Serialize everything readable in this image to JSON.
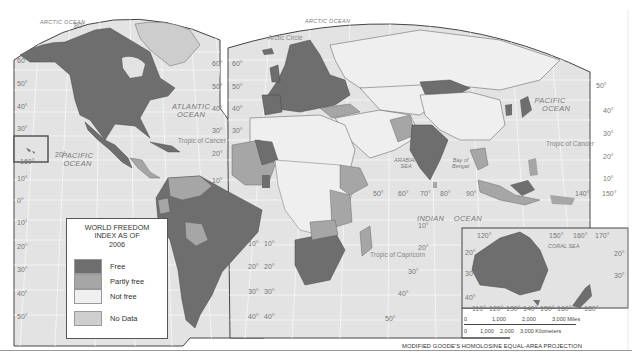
{
  "map": {
    "title": "World Freedom Index as of 2006",
    "projection": "MODIFIED GOODE'S HOMOLOSINE EQUAL-AREA PROJECTION",
    "colors": {
      "ocean": "#e4e4e4",
      "free": "#6e6e6e",
      "partly_free": "#a6a6a6",
      "not_free": "#efefef",
      "no_data": "#cfcfcf",
      "border": "#444444"
    },
    "oceans": [
      {
        "name": "ARCTIC OCEAN",
        "id": "arctic-ocean-west"
      },
      {
        "name": "ATLANTIC OCEAN",
        "id": "atlantic-ocean"
      },
      {
        "name": "PACIFIC OCEAN",
        "id": "pacific-ocean-west"
      },
      {
        "name": "ARCTIC OCEAN",
        "id": "arctic-ocean-east"
      },
      {
        "name": "PACIFIC OCEAN",
        "id": "pacific-ocean-east"
      },
      {
        "name": "INDIAN OCEAN",
        "id": "indian-ocean"
      }
    ],
    "labels": {
      "arctic_west": "ARCTIC OCEAN",
      "arctic_east": "ARCTIC OCEAN",
      "arctic_circle": "Arctic Circle",
      "atlantic_1": "ATLANTIC",
      "atlantic_2": "OCEAN",
      "pacific_w_1": "PACIFIC",
      "pacific_w_2": "OCEAN",
      "pacific_e_1": "PACIFIC",
      "pacific_e_2": "OCEAN",
      "indian_1": "INDIAN",
      "indian_2": "OCEAN",
      "arabian_1": "ARABIAN",
      "arabian_2": "SEA",
      "bengal_1": "Bay of",
      "bengal_2": "Bengal",
      "coral_sea": "CORAL SEA",
      "tropic_cancer_w": "Tropic of Cancer",
      "tropic_cancer_e": "Tropic of Cancer",
      "tropic_capricorn": "Tropic of Capricorn"
    },
    "lat_ticks_left": [
      "80°",
      "60°",
      "50°",
      "40°",
      "30°",
      "20°",
      "10°",
      "0°",
      "10°",
      "20°",
      "30°",
      "40°",
      "50°"
    ],
    "lat_ticks_mid_a": [
      "60°",
      "50°",
      "40°",
      "30°",
      "20°",
      "10°",
      "0°",
      "10°",
      "20°",
      "30°",
      "40°",
      "50°"
    ],
    "lat_ticks_mid_b": [
      "60°",
      "50°",
      "40°",
      "30°",
      "20°",
      "10°",
      "0°",
      "10°",
      "20°",
      "30°",
      "40°",
      "50°"
    ],
    "lat_ticks_right": [
      "50°",
      "40°",
      "30°",
      "20°",
      "10°"
    ],
    "lat_ticks_africa": [
      "10°",
      "20°",
      "30°",
      "40°",
      "50°"
    ],
    "lon_ticks_indian": [
      "50°",
      "60°",
      "70°",
      "80°",
      "90°"
    ],
    "lon_ticks_pacific": [
      "140°",
      "150°"
    ],
    "hawaii_inset": {
      "lon": "160°",
      "lat": "20°"
    },
    "australia_inset": {
      "lon_top": [
        "120°",
        "150°",
        "160°",
        "170°"
      ],
      "lon_bottom": [
        "110°",
        "120°",
        "130°",
        "140°",
        "150°",
        "160°",
        "180°"
      ],
      "lat": [
        "20°",
        "30°",
        "40°"
      ],
      "lat_right": [
        "20°",
        "30°"
      ]
    }
  },
  "legend": {
    "title_lines": [
      "WORLD FREEDOM",
      "INDEX AS OF",
      "2006"
    ],
    "items": [
      {
        "label": "Free",
        "color": "#6e6e6e"
      },
      {
        "label": "Partly free",
        "color": "#a6a6a6"
      },
      {
        "label": "Not free",
        "color": "#efefef"
      },
      {
        "label": "No Data",
        "color": "#cfcfcf"
      }
    ]
  },
  "scale_bar": {
    "miles": [
      "0",
      "1,000",
      "2,000",
      "3,000 Miles"
    ],
    "kilometers": [
      "0",
      "1,000",
      "2,000",
      "3,000 Kilometers"
    ]
  }
}
